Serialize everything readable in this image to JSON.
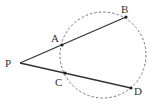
{
  "diagram": {
    "type": "secant-secant geometry figure",
    "circle": {
      "style": "dashed",
      "cx": 103,
      "cy": 55,
      "r": 43
    },
    "points": [
      {
        "name": "P",
        "label": "P",
        "x": 20,
        "y": 63,
        "lx": 5,
        "ly": 67
      },
      {
        "name": "A",
        "label": "A",
        "x": 62,
        "y": 45,
        "lx": 51,
        "ly": 42
      },
      {
        "name": "B",
        "label": "B",
        "x": 126,
        "y": 17,
        "lx": 121,
        "ly": 13
      },
      {
        "name": "C",
        "label": "C",
        "x": 65,
        "y": 73,
        "lx": 55,
        "ly": 86
      },
      {
        "name": "D",
        "label": "D",
        "x": 131,
        "y": 88,
        "lx": 134,
        "ly": 95
      }
    ],
    "segments": [
      {
        "from": "P",
        "to": "B"
      },
      {
        "from": "P",
        "to": "D"
      }
    ],
    "colors": {
      "stroke": "#333333",
      "circle": "#777777"
    }
  }
}
